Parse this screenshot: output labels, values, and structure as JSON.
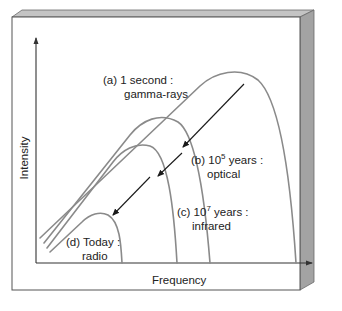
{
  "diagram": {
    "type": "blackbody-spectra-evolution",
    "axes": {
      "x_label": "Frequency",
      "y_label": "Intensity"
    },
    "curves": [
      {
        "id": "a",
        "line1": "(a) 1 second :",
        "line2": "gamma-rays"
      },
      {
        "id": "b",
        "prefix": "(b) 10",
        "exponent": "5",
        "suffix": " years :",
        "line2": "optical"
      },
      {
        "id": "c",
        "prefix": "(c) 10",
        "exponent": "7",
        "suffix": " years :",
        "line2": "infrared"
      },
      {
        "id": "d",
        "line1": "(d) Today :",
        "line2": "radio"
      }
    ],
    "colors": {
      "curve": "#8a8a8a",
      "arrow": "#1a1a1a",
      "axis": "#333333",
      "frame_side": "#9c9c9c",
      "frame_top": "#bdbdbd"
    }
  }
}
